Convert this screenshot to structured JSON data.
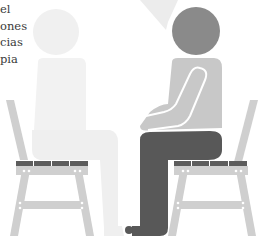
{
  "text_fragment": {
    "lines": [
      "el",
      "ones",
      "cias",
      "pia"
    ]
  },
  "illustration": {
    "subject": "two-people-seated-facing-each-other-on-chairs",
    "colors": {
      "chair_frame": "#cfcfcf",
      "chair_seat_slats": "#5c5c5c",
      "left_person": "#f0f0f0",
      "right_person_head": "#8a8a8a",
      "right_person_torso": "#c8c8c8",
      "right_person_legs": "#585858",
      "speech_bubble_tail": "#ececec",
      "background": "#ffffff"
    }
  }
}
